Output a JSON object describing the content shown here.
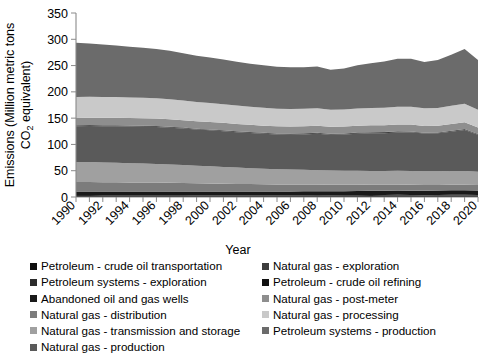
{
  "chart_data": {
    "type": "area",
    "stacked": true,
    "title": "",
    "xlabel": "Year",
    "ylabel": "Emissions (Million metric tons CO2 equivalent)",
    "ylabel_line1": "Emissions (Million metric tons",
    "ylabel_line2_pre": "CO",
    "ylabel_line2_sub": "2",
    "ylabel_line2_post": " equivalent)",
    "ylim": [
      0,
      350
    ],
    "yticks": [
      0,
      50,
      100,
      150,
      200,
      250,
      300,
      350
    ],
    "xlim": [
      1990,
      2020
    ],
    "grid": false,
    "legend_position": "bottom",
    "x": [
      1990,
      1991,
      1992,
      1993,
      1994,
      1995,
      1996,
      1997,
      1998,
      1999,
      2000,
      2001,
      2002,
      2003,
      2004,
      2005,
      2006,
      2007,
      2008,
      2009,
      2010,
      2011,
      2012,
      2013,
      2014,
      2015,
      2016,
      2017,
      2018,
      2019,
      2020
    ],
    "xtick_labels": [
      "1990",
      "1992",
      "1994",
      "1996",
      "1998",
      "2000",
      "2002",
      "2004",
      "2006",
      "2008",
      "2010",
      "2012",
      "2014",
      "2016",
      "2018",
      "2020"
    ],
    "series": [
      {
        "name": "Petroleum - crude oil transportation",
        "color": "#0e0e0e",
        "values": [
          2.1,
          2.1,
          2.0,
          2.0,
          2.0,
          2.0,
          1.9,
          1.9,
          1.9,
          1.8,
          1.8,
          1.8,
          1.7,
          1.7,
          1.7,
          1.7,
          1.7,
          1.7,
          1.7,
          1.7,
          1.8,
          1.9,
          2.0,
          2.2,
          2.4,
          2.4,
          2.4,
          2.5,
          2.7,
          2.8,
          2.6
        ]
      },
      {
        "name": "Petroleum systems - exploration",
        "color": "#2b2b2b",
        "values": [
          1.6,
          1.6,
          1.5,
          1.5,
          1.4,
          1.4,
          1.4,
          1.4,
          1.3,
          1.2,
          1.2,
          1.2,
          1.1,
          1.1,
          1.1,
          1.1,
          1.2,
          1.3,
          1.4,
          1.2,
          1.3,
          1.5,
          1.6,
          1.7,
          1.8,
          1.3,
          1.0,
          1.2,
          1.4,
          1.4,
          1.0
        ]
      },
      {
        "name": "Abandoned oil and gas wells",
        "color": "#1a1a1a",
        "values": [
          6.8,
          6.9,
          6.9,
          7.0,
          7.0,
          7.1,
          7.1,
          7.2,
          7.3,
          7.3,
          7.4,
          7.4,
          7.5,
          7.6,
          7.6,
          7.7,
          7.7,
          7.8,
          7.9,
          7.9,
          8.0,
          8.1,
          8.2,
          8.2,
          8.3,
          8.4,
          8.4,
          8.5,
          8.6,
          8.7,
          8.7
        ]
      },
      {
        "name": "Natural gas - distribution",
        "color": "#7c7c7c",
        "values": [
          18.0,
          18.0,
          17.8,
          17.6,
          17.4,
          17.2,
          17.0,
          16.6,
          16.2,
          15.8,
          15.4,
          15.0,
          14.6,
          14.2,
          13.8,
          13.4,
          13.0,
          12.8,
          12.6,
          12.4,
          12.2,
          12.0,
          11.8,
          11.6,
          11.4,
          11.2,
          11.0,
          10.8,
          10.6,
          10.5,
          10.3
        ]
      },
      {
        "name": "Natural gas - transmission and storage",
        "color": "#a0a0a0",
        "values": [
          38.0,
          38.0,
          37.5,
          37.0,
          36.5,
          36.0,
          35.5,
          34.8,
          34.0,
          33.2,
          32.5,
          31.8,
          31.0,
          30.2,
          29.5,
          29.0,
          28.5,
          28.0,
          27.5,
          27.0,
          26.5,
          26.2,
          26.0,
          25.8,
          26.0,
          26.2,
          26.0,
          25.8,
          26.0,
          26.2,
          25.6
        ]
      },
      {
        "name": "Natural gas - production",
        "color": "#5a5a5a",
        "values": [
          68.0,
          68.5,
          69.0,
          69.5,
          69.8,
          70.0,
          70.2,
          70.0,
          69.5,
          69.0,
          68.5,
          68.0,
          67.5,
          67.0,
          66.5,
          66.0,
          66.5,
          67.5,
          69.0,
          68.0,
          69.0,
          70.5,
          71.5,
          72.0,
          73.0,
          73.5,
          72.0,
          72.5,
          75.0,
          78.0,
          70.0
        ]
      },
      {
        "name": "Natural gas - exploration",
        "color": "#3d3d3d",
        "values": [
          1.2,
          1.2,
          1.2,
          1.3,
          1.3,
          1.3,
          1.3,
          1.3,
          1.2,
          1.1,
          1.2,
          1.3,
          1.2,
          1.2,
          1.3,
          1.4,
          1.5,
          1.6,
          1.7,
          1.4,
          1.5,
          1.7,
          1.6,
          1.5,
          1.6,
          1.2,
          0.9,
          1.0,
          1.2,
          1.3,
          0.9
        ]
      },
      {
        "name": "Petroleum - crude oil refining",
        "color": "#111111",
        "values": [
          0.6,
          0.6,
          0.6,
          0.6,
          0.6,
          0.6,
          0.6,
          0.6,
          0.6,
          0.6,
          0.6,
          0.6,
          0.6,
          0.6,
          0.6,
          0.6,
          0.6,
          0.6,
          0.6,
          0.6,
          0.6,
          0.6,
          0.6,
          0.6,
          0.6,
          0.6,
          0.6,
          0.6,
          0.6,
          0.6,
          0.6
        ]
      },
      {
        "name": "Natural gas - post-meter",
        "color": "#8e8e8e",
        "values": [
          14.0,
          14.0,
          14.1,
          14.1,
          14.2,
          14.2,
          14.2,
          14.2,
          14.1,
          14.0,
          14.0,
          13.9,
          13.8,
          13.7,
          13.6,
          13.5,
          13.4,
          13.4,
          13.3,
          13.2,
          13.2,
          13.1,
          13.0,
          13.0,
          13.0,
          12.9,
          12.8,
          12.8,
          12.8,
          12.8,
          12.6
        ]
      },
      {
        "name": "Natural gas - processing",
        "color": "#c9c9c9",
        "values": [
          40.0,
          40.0,
          39.8,
          39.5,
          39.2,
          39.0,
          38.6,
          38.0,
          37.4,
          36.8,
          36.2,
          35.6,
          35.0,
          34.4,
          34.0,
          33.5,
          33.2,
          33.0,
          33.0,
          32.6,
          32.5,
          32.8,
          33.0,
          33.2,
          33.8,
          34.0,
          33.5,
          33.8,
          34.5,
          35.0,
          33.5
        ]
      },
      {
        "name": "Petroleum systems - production",
        "color": "#6b6b6b",
        "values": [
          103.0,
          101.0,
          99.5,
          98.0,
          96.5,
          95.0,
          93.5,
          92.0,
          90.0,
          88.0,
          86.5,
          85.0,
          83.5,
          82.0,
          81.0,
          80.0,
          79.5,
          79.0,
          79.5,
          76.0,
          78.0,
          82.0,
          85.0,
          88.0,
          91.0,
          91.5,
          88.0,
          91.0,
          97.0,
          104.0,
          95.0
        ]
      }
    ],
    "totals": [
      293.3,
      291.9,
      289.9,
      288.1,
      285.9,
      283.8,
      281.3,
      278.0,
      273.5,
      268.8,
      265.3,
      262.6,
      257.5,
      253.9,
      251.1,
      248.9,
      247.8,
      248.7,
      249.2,
      242.0,
      244.6,
      252.4,
      255.3,
      259.8,
      264.9,
      264.2,
      257.6,
      262.5,
      271.4,
      283.3,
      261.8
    ]
  },
  "legend": {
    "left_column": [
      {
        "label": "Petroleum - crude oil transportation",
        "color": "#0e0e0e"
      },
      {
        "label": "Petroleum systems - exploration",
        "color": "#2b2b2b"
      },
      {
        "label": "Abandoned oil and gas wells",
        "color": "#1a1a1a"
      },
      {
        "label": "Natural gas - distribution",
        "color": "#7c7c7c"
      },
      {
        "label": "Natural gas - transmission and storage",
        "color": "#a0a0a0"
      },
      {
        "label": "Natural gas - production",
        "color": "#5a5a5a"
      }
    ],
    "right_column": [
      {
        "label": "Natural gas - exploration",
        "color": "#3d3d3d"
      },
      {
        "label": "Petroleum - crude oil refining",
        "color": "#111111"
      },
      {
        "label": "Natural gas - post-meter",
        "color": "#8e8e8e"
      },
      {
        "label": "Natural gas - processing",
        "color": "#c9c9c9"
      },
      {
        "label": "Petroleum systems - production",
        "color": "#6b6b6b"
      }
    ]
  }
}
